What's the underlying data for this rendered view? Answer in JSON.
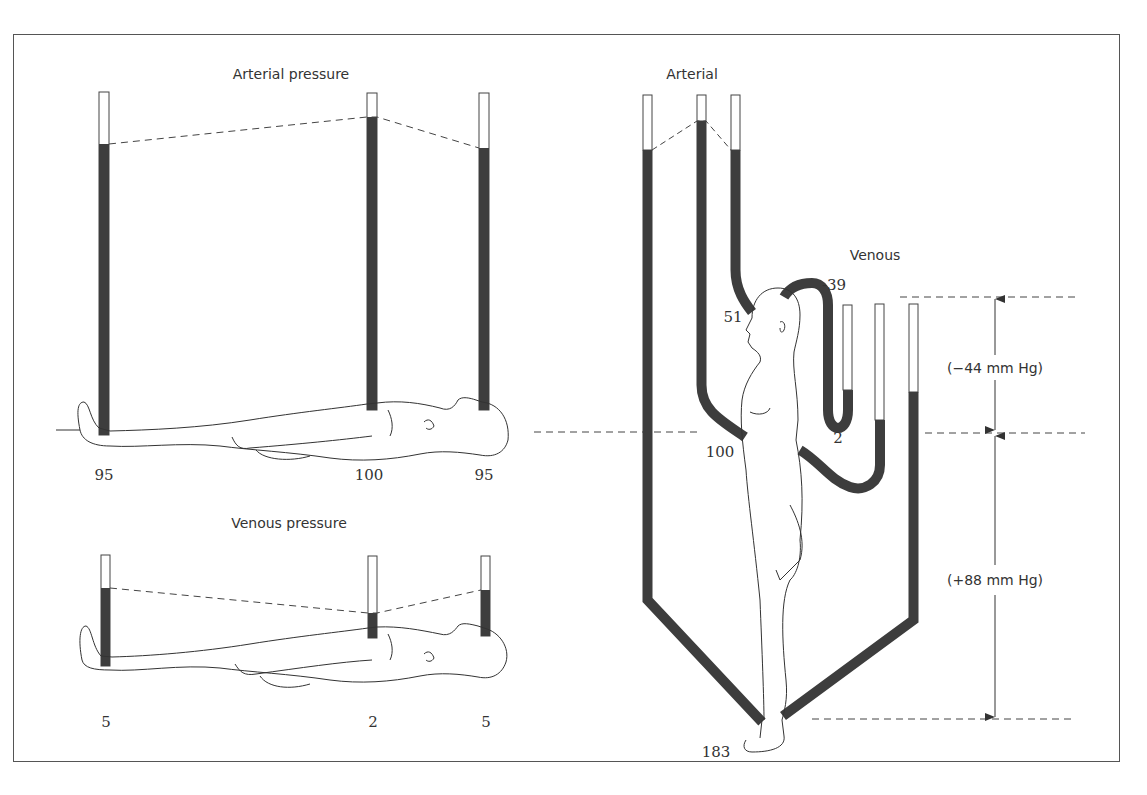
{
  "figure": {
    "left_panel": {
      "arterial": {
        "title": "Arterial pressure",
        "readings": [
          {
            "site": "ankle",
            "value": "95"
          },
          {
            "site": "heart",
            "value": "100"
          },
          {
            "site": "head",
            "value": "95"
          }
        ]
      },
      "venous": {
        "title": "Venous pressure",
        "readings": [
          {
            "site": "ankle",
            "value": "5"
          },
          {
            "site": "heart",
            "value": "2"
          },
          {
            "site": "head",
            "value": "5"
          }
        ]
      }
    },
    "right_panel": {
      "arterial_title": "Arterial",
      "venous_title": "Venous",
      "arterial_readings": {
        "head": "51",
        "heart": "100",
        "foot": "183"
      },
      "venous_readings": {
        "head": "-39",
        "heart": "2"
      },
      "dimension_labels": {
        "above_heart": "(−44 mm Hg)",
        "below_heart": "(+88 mm Hg)"
      }
    },
    "colors": {
      "fluid": "#3d3d3d",
      "line": "#444444",
      "background": "#ffffff"
    }
  }
}
